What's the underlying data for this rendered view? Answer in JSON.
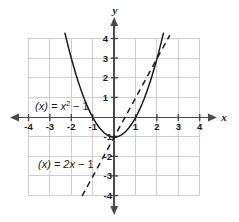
{
  "figure": {
    "background_color": "#ffffff",
    "grid_color": "#cfcfcf",
    "axis_color": "#4a4a4a",
    "curve_color": "#1a1a1a",
    "text_color": "#1a1a1a"
  },
  "axes": {
    "x_name": "x",
    "y_name": "y",
    "x_ticks": [
      "-4",
      "-3",
      "-2",
      "-1",
      "1",
      "2",
      "3",
      "4"
    ],
    "y_ticks": [
      "4",
      "3",
      "2",
      "1",
      "-1",
      "-2",
      "-3",
      "-4"
    ],
    "x_tick_values": [
      -4,
      -3,
      -2,
      -1,
      1,
      2,
      3,
      4
    ],
    "y_tick_values": [
      4,
      3,
      2,
      1,
      -1,
      -2,
      -3,
      -4
    ]
  },
  "labels": {
    "parabola": {
      "prefix": "(x) = ",
      "var": "x",
      "exponent": "2",
      "suffix": " − 1",
      "full": "(x) = x2 − 1"
    },
    "line": {
      "prefix": "(x) = 2",
      "var": "x",
      "suffix": " − 1",
      "full": "(x) = 2x − 1"
    }
  },
  "chart_data": {
    "type": "line",
    "title": "",
    "xlabel": "x",
    "ylabel": "y",
    "xlim": [
      -4,
      4
    ],
    "ylim": [
      -4,
      4
    ],
    "grid": true,
    "legend_position": "inline-annotation",
    "series": [
      {
        "name": "(x) = x2 − 1",
        "equation": "f(x) = x^2 - 1",
        "style": "solid",
        "color": "#1a1a1a",
        "x": [
          -2.3,
          -2.2,
          -2.1,
          -2.0,
          -1.9,
          -1.8,
          -1.7,
          -1.6,
          -1.5,
          -1.4,
          -1.3,
          -1.2,
          -1.1,
          -1.0,
          -0.9,
          -0.8,
          -0.7,
          -0.6,
          -0.5,
          -0.4,
          -0.3,
          -0.2,
          -0.1,
          0.0,
          0.1,
          0.2,
          0.3,
          0.4,
          0.5,
          0.6,
          0.7,
          0.8,
          0.9,
          1.0,
          1.1,
          1.2,
          1.3,
          1.4,
          1.5,
          1.6,
          1.7,
          1.8,
          1.9,
          2.0,
          2.1,
          2.2,
          2.3
        ],
        "y": [
          4.29,
          3.84,
          3.41,
          3.0,
          2.61,
          2.24,
          1.89,
          1.56,
          1.25,
          0.96,
          0.69,
          0.44,
          0.21,
          0.0,
          -0.19,
          -0.36,
          -0.51,
          -0.64,
          -0.75,
          -0.84,
          -0.91,
          -0.96,
          -0.99,
          -1.0,
          -0.99,
          -0.96,
          -0.91,
          -0.84,
          -0.75,
          -0.64,
          -0.51,
          -0.36,
          -0.19,
          0.0,
          0.21,
          0.44,
          0.69,
          0.96,
          1.25,
          1.56,
          1.89,
          2.24,
          2.61,
          3.0,
          3.41,
          3.84,
          4.29
        ],
        "roots": [
          -1,
          1
        ],
        "vertex": [
          0,
          -1
        ]
      },
      {
        "name": "(x) = 2x − 1",
        "equation": "f(x) = 2x - 1",
        "style": "dashed",
        "color": "#1a1a1a",
        "x": [
          -1.5,
          2.6
        ],
        "y": [
          -4.0,
          4.2
        ],
        "slope": 2,
        "intercept": -1
      }
    ]
  }
}
